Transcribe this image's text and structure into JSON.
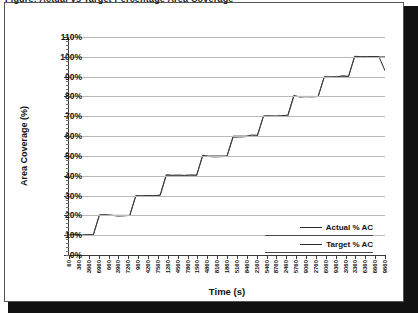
{
  "top_clipped_text": "Figure: Actual vs Target Percentage Area Coverage",
  "chart_data": {
    "type": "line",
    "title": "",
    "xlabel": "Time (s)",
    "ylabel": "Area Coverage (%)",
    "ylim": [
      0,
      110
    ],
    "ytick_labels": [
      "0%",
      "10%",
      "20%",
      "30%",
      "40%",
      "50%",
      "60%",
      "70%",
      "80%",
      "90%",
      "100%",
      "110%"
    ],
    "ytick_values": [
      0,
      10,
      20,
      30,
      40,
      50,
      60,
      70,
      80,
      90,
      100,
      110
    ],
    "grid": true,
    "legend_position": "inside-right",
    "xtick_labels": [
      "60",
      "360",
      "3660",
      "6960",
      "660",
      "3960",
      "7260",
      "960",
      "4260",
      "7560",
      "1260",
      "4560",
      "7860",
      "1560",
      "4860",
      "8160",
      "1860",
      "5160",
      "8460",
      "2160",
      "5460",
      "8760",
      "2460",
      "5760",
      "9060",
      "2760",
      "6060",
      "9360",
      "3060",
      "3360",
      "6360",
      "6660",
      "9660"
    ],
    "series": [
      {
        "name": "Actual % AC",
        "color": "#2b2b2b",
        "values": [
          10,
          10,
          10,
          10,
          10,
          20,
          20,
          20,
          20,
          20,
          20,
          30,
          30,
          30,
          30,
          30,
          40,
          40,
          40,
          40,
          40,
          40,
          50,
          50,
          50,
          50,
          50,
          60,
          60,
          60,
          60,
          60,
          70,
          70,
          70,
          70,
          70,
          80,
          80,
          80,
          80,
          80,
          90,
          90,
          90,
          90,
          90,
          100,
          100,
          100,
          100,
          100,
          93
        ]
      },
      {
        "name": "Target % AC",
        "color": "#3d3d3d",
        "values": [
          10,
          10,
          10,
          10,
          10,
          20,
          20,
          20,
          20,
          20,
          20,
          30,
          30,
          30,
          30,
          30,
          40,
          40,
          40,
          40,
          40,
          40,
          50,
          50,
          50,
          50,
          50,
          60,
          60,
          60,
          60,
          60,
          70,
          70,
          70,
          70,
          70,
          80,
          80,
          80,
          80,
          80,
          90,
          90,
          90,
          90,
          90,
          100,
          100,
          100,
          100,
          100,
          100
        ]
      }
    ],
    "step_levels": [
      10,
      20,
      30,
      40,
      50,
      60,
      70,
      80,
      90,
      100
    ],
    "final_actual_value": 93
  },
  "legend": {
    "items": [
      {
        "label": "Actual % AC"
      },
      {
        "label": "Target % AC"
      }
    ]
  }
}
